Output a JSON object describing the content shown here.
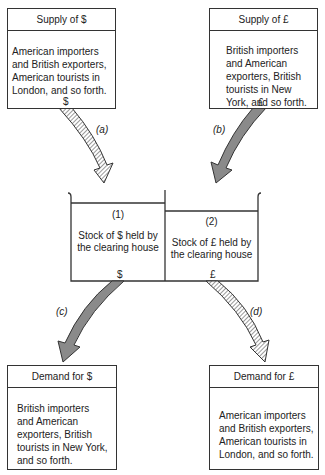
{
  "supply_dollar": {
    "title": "Supply of $",
    "text": "American importers and British exporters, American tourists in London, and so forth.",
    "currency": "$"
  },
  "supply_pound": {
    "title": "Supply of £",
    "text": "British importers and American exporters, British tourists in New York, and so forth.",
    "currency": "£"
  },
  "clearing_house": {
    "dollar_stock": {
      "number": "(1)",
      "text": "Stock of $ held by the clearing house",
      "currency": "$"
    },
    "pound_stock": {
      "number": "(2)",
      "text": "Stock of £ held by the clearing house",
      "currency": "£"
    }
  },
  "demand_dollar": {
    "title": "Demand for $",
    "text": "British importers and American exporters, British tourists in New York, and so forth."
  },
  "demand_pound": {
    "title": "Demand for £",
    "text": "American importers and British exporters, American tourists in London, and so forth."
  },
  "flows": [
    {
      "label": "(a)",
      "style": "hatched",
      "from": "Supply of $",
      "to": "Stock of $"
    },
    {
      "label": "(b)",
      "style": "solid-gray",
      "from": "Supply of £",
      "to": "Stock of £"
    },
    {
      "label": "(c)",
      "style": "solid-gray",
      "from": "Stock of $",
      "to": "Demand for $"
    },
    {
      "label": "(d)",
      "style": "hatched",
      "from": "Stock of £",
      "to": "Demand for £"
    }
  ],
  "colors": {
    "line": "#333333",
    "solid_arrow": "#8a8a8a",
    "hatch": "#555555"
  }
}
